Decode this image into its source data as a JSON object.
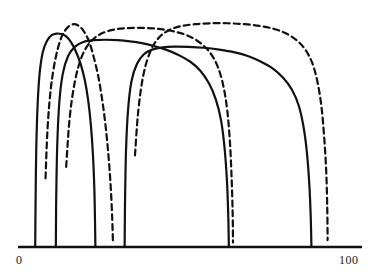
{
  "figure": {
    "title": "",
    "background_color": "#ffffff",
    "ink_color": "#111111"
  },
  "axis": {
    "orientation": "horizontal",
    "min_label": "0",
    "max_label": "100",
    "min_value": 0,
    "max_value": 100,
    "pixel_start_x": 18,
    "pixel_end_x": 362,
    "baseline_y": 247,
    "line_width": 2.6,
    "ticks_visible": false
  },
  "chart_data": {
    "type": "line",
    "title": "",
    "xlabel": "",
    "ylabel": "",
    "xlim": [
      0,
      100
    ],
    "ylim": [
      0,
      1
    ],
    "grid": false,
    "legend": "none",
    "tick_labels": [
      "0",
      "100"
    ],
    "annotations": [],
    "series": [
      {
        "name": "curve-1-solid-narrow",
        "style": "solid",
        "color": "#111111",
        "line_width": 2.2,
        "x_left_foot": 5,
        "x_right_foot": 22,
        "peak_x": 13,
        "peak_y": 0.93,
        "points": [
          [
            5.0,
            0.0
          ],
          [
            5.1,
            0.18
          ],
          [
            5.3,
            0.42
          ],
          [
            5.7,
            0.62
          ],
          [
            6.3,
            0.76
          ],
          [
            7.2,
            0.85
          ],
          [
            8.4,
            0.9
          ],
          [
            9.8,
            0.925
          ],
          [
            11.2,
            0.932
          ],
          [
            12.6,
            0.93
          ],
          [
            14.0,
            0.92
          ],
          [
            15.4,
            0.895
          ],
          [
            16.8,
            0.855
          ],
          [
            18.2,
            0.8
          ],
          [
            19.4,
            0.73
          ],
          [
            20.4,
            0.64
          ],
          [
            21.2,
            0.53
          ],
          [
            21.8,
            0.4
          ],
          [
            22.2,
            0.25
          ],
          [
            22.4,
            0.1
          ],
          [
            22.5,
            0.0
          ]
        ]
      },
      {
        "name": "curve-2-dashed-narrow",
        "style": "dashed",
        "color": "#111111",
        "line_width": 2.2,
        "dash_pattern": "6 4",
        "x_left_foot": 8,
        "x_right_foot": 27,
        "peak_x": 16,
        "peak_y": 0.975,
        "points": [
          [
            8.0,
            0.3
          ],
          [
            8.6,
            0.52
          ],
          [
            9.6,
            0.7
          ],
          [
            11.0,
            0.83
          ],
          [
            12.6,
            0.915
          ],
          [
            14.2,
            0.955
          ],
          [
            15.8,
            0.972
          ],
          [
            17.4,
            0.968
          ],
          [
            19.0,
            0.945
          ],
          [
            20.6,
            0.9
          ],
          [
            22.0,
            0.83
          ],
          [
            23.4,
            0.74
          ],
          [
            24.6,
            0.63
          ],
          [
            25.6,
            0.51
          ],
          [
            26.4,
            0.38
          ],
          [
            27.0,
            0.25
          ],
          [
            27.4,
            0.12
          ],
          [
            27.6,
            0.02
          ]
        ]
      },
      {
        "name": "curve-3-solid-mid-left",
        "style": "solid",
        "color": "#111111",
        "line_width": 2.2,
        "x_left_foot": 11,
        "x_right_foot": 61,
        "peak_x": 33,
        "peak_y": 0.905,
        "points": [
          [
            11.0,
            0.0
          ],
          [
            11.1,
            0.2
          ],
          [
            11.4,
            0.44
          ],
          [
            12.0,
            0.63
          ],
          [
            13.0,
            0.755
          ],
          [
            14.6,
            0.835
          ],
          [
            16.6,
            0.875
          ],
          [
            19.0,
            0.895
          ],
          [
            22.0,
            0.903
          ],
          [
            25.5,
            0.905
          ],
          [
            29.0,
            0.903
          ],
          [
            32.5,
            0.898
          ],
          [
            36.0,
            0.89
          ],
          [
            39.5,
            0.878
          ],
          [
            43.0,
            0.862
          ],
          [
            46.5,
            0.84
          ],
          [
            50.0,
            0.81
          ],
          [
            53.0,
            0.77
          ],
          [
            55.5,
            0.715
          ],
          [
            57.5,
            0.645
          ],
          [
            59.0,
            0.555
          ],
          [
            60.0,
            0.44
          ],
          [
            60.7,
            0.3
          ],
          [
            61.1,
            0.15
          ],
          [
            61.3,
            0.0
          ]
        ]
      },
      {
        "name": "curve-4-dashed-mid",
        "style": "dashed",
        "color": "#111111",
        "line_width": 2.2,
        "dash_pattern": "6 4",
        "x_left_foot": 14,
        "x_right_foot": 62,
        "peak_x": 38,
        "peak_y": 0.955,
        "points": [
          [
            14.0,
            0.35
          ],
          [
            15.0,
            0.56
          ],
          [
            16.5,
            0.72
          ],
          [
            18.5,
            0.83
          ],
          [
            21.0,
            0.895
          ],
          [
            24.0,
            0.93
          ],
          [
            27.5,
            0.948
          ],
          [
            31.0,
            0.955
          ],
          [
            35.0,
            0.957
          ],
          [
            39.0,
            0.955
          ],
          [
            43.0,
            0.948
          ],
          [
            47.0,
            0.935
          ],
          [
            50.5,
            0.915
          ],
          [
            53.5,
            0.885
          ],
          [
            56.0,
            0.845
          ],
          [
            58.0,
            0.79
          ],
          [
            59.6,
            0.71
          ],
          [
            60.8,
            0.6
          ],
          [
            61.6,
            0.46
          ],
          [
            62.1,
            0.3
          ],
          [
            62.4,
            0.15
          ],
          [
            62.5,
            0.02
          ]
        ]
      },
      {
        "name": "curve-5-solid-wide",
        "style": "solid",
        "color": "#111111",
        "line_width": 2.2,
        "x_left_foot": 31,
        "x_right_foot": 85,
        "peak_x": 58,
        "peak_y": 0.875,
        "points": [
          [
            31.0,
            0.0
          ],
          [
            31.1,
            0.18
          ],
          [
            31.4,
            0.42
          ],
          [
            32.0,
            0.6
          ],
          [
            33.0,
            0.725
          ],
          [
            34.6,
            0.8
          ],
          [
            36.6,
            0.842
          ],
          [
            39.0,
            0.862
          ],
          [
            42.0,
            0.872
          ],
          [
            45.5,
            0.875
          ],
          [
            49.5,
            0.874
          ],
          [
            54.0,
            0.87
          ],
          [
            58.5,
            0.862
          ],
          [
            63.0,
            0.85
          ],
          [
            67.0,
            0.833
          ],
          [
            70.5,
            0.81
          ],
          [
            74.0,
            0.78
          ],
          [
            77.0,
            0.74
          ],
          [
            79.6,
            0.688
          ],
          [
            81.6,
            0.618
          ],
          [
            83.0,
            0.525
          ],
          [
            84.0,
            0.41
          ],
          [
            84.7,
            0.27
          ],
          [
            85.1,
            0.13
          ],
          [
            85.3,
            0.0
          ]
        ]
      },
      {
        "name": "curve-6-dashed-wide",
        "style": "dashed",
        "color": "#111111",
        "line_width": 2.2,
        "dash_pattern": "6 4",
        "x_left_foot": 34,
        "x_right_foot": 90,
        "peak_x": 62,
        "peak_y": 0.975,
        "points": [
          [
            34.0,
            0.4
          ],
          [
            35.0,
            0.6
          ],
          [
            36.5,
            0.755
          ],
          [
            38.5,
            0.855
          ],
          [
            41.0,
            0.915
          ],
          [
            44.0,
            0.948
          ],
          [
            47.5,
            0.965
          ],
          [
            51.5,
            0.973
          ],
          [
            56.0,
            0.977
          ],
          [
            61.0,
            0.977
          ],
          [
            66.0,
            0.973
          ],
          [
            70.5,
            0.965
          ],
          [
            74.5,
            0.952
          ],
          [
            78.0,
            0.932
          ],
          [
            81.0,
            0.903
          ],
          [
            83.5,
            0.862
          ],
          [
            85.5,
            0.805
          ],
          [
            87.0,
            0.725
          ],
          [
            88.2,
            0.615
          ],
          [
            89.0,
            0.48
          ],
          [
            89.6,
            0.33
          ],
          [
            89.9,
            0.17
          ],
          [
            90.0,
            0.03
          ]
        ]
      }
    ]
  }
}
